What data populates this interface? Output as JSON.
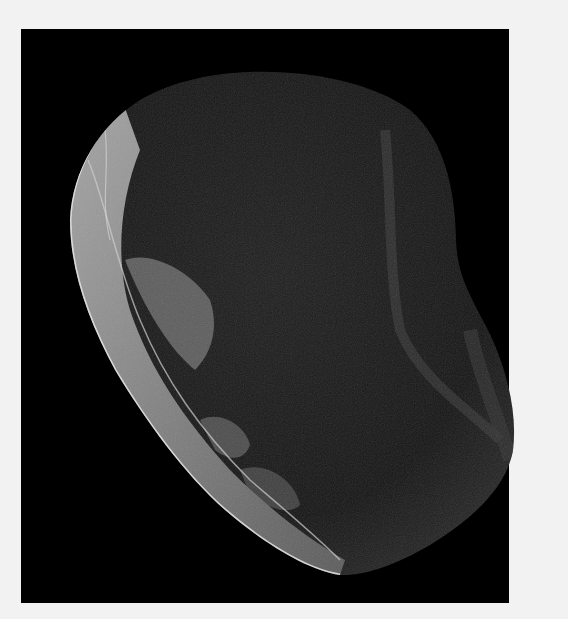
{
  "image": {
    "subject": "stone flake scraper artifact",
    "background_color": "#000000",
    "border_color": "#f2f2f2",
    "artifact_base_color": "#1a1a1a",
    "retouched_edge_color": "#b8b8b8"
  }
}
